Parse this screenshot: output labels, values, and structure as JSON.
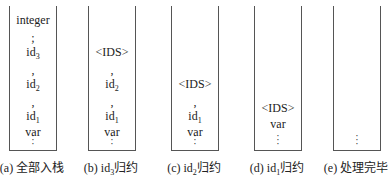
{
  "stacks": [
    {
      "id": "a",
      "caption": {
        "prefix": "(a) ",
        "text": "全部入栈",
        "sub": ""
      },
      "items": [
        {
          "t": "integer",
          "y": 14
        },
        {
          "t": ";",
          "y": 32
        },
        {
          "t": "id",
          "sub": "3",
          "y": 46
        },
        {
          "t": ",",
          "y": 64
        },
        {
          "t": "id",
          "sub": "2",
          "y": 78
        },
        {
          "t": ",",
          "y": 96
        },
        {
          "t": "id",
          "sub": "1",
          "y": 110
        },
        {
          "t": "var",
          "y": 126
        }
      ]
    },
    {
      "id": "b",
      "caption": {
        "prefix": "(b) id",
        "sub": "3",
        "text": "归约"
      },
      "items": [
        {
          "t": "<IDS>",
          "y": 46
        },
        {
          "t": ",",
          "y": 64
        },
        {
          "t": "id",
          "sub": "2",
          "y": 78
        },
        {
          "t": ",",
          "y": 96
        },
        {
          "t": "id",
          "sub": "1",
          "y": 110
        },
        {
          "t": "var",
          "y": 126
        }
      ]
    },
    {
      "id": "c",
      "caption": {
        "prefix": "(c) id",
        "sub": "2",
        "text": "归约"
      },
      "items": [
        {
          "t": "<IDS>",
          "y": 78
        },
        {
          "t": ",",
          "y": 96
        },
        {
          "t": "id",
          "sub": "1",
          "y": 110
        },
        {
          "t": "var",
          "y": 126
        }
      ]
    },
    {
      "id": "d",
      "caption": {
        "prefix": "(d) id",
        "sub": "1",
        "text": "归约"
      },
      "items": [
        {
          "t": "<IDS>",
          "y": 102
        },
        {
          "t": "var",
          "y": 118
        }
      ]
    },
    {
      "id": "e",
      "caption": {
        "prefix": "(e) ",
        "text": "处理完毕",
        "sub": ""
      },
      "items": []
    }
  ],
  "bottom_marker": "⋮"
}
